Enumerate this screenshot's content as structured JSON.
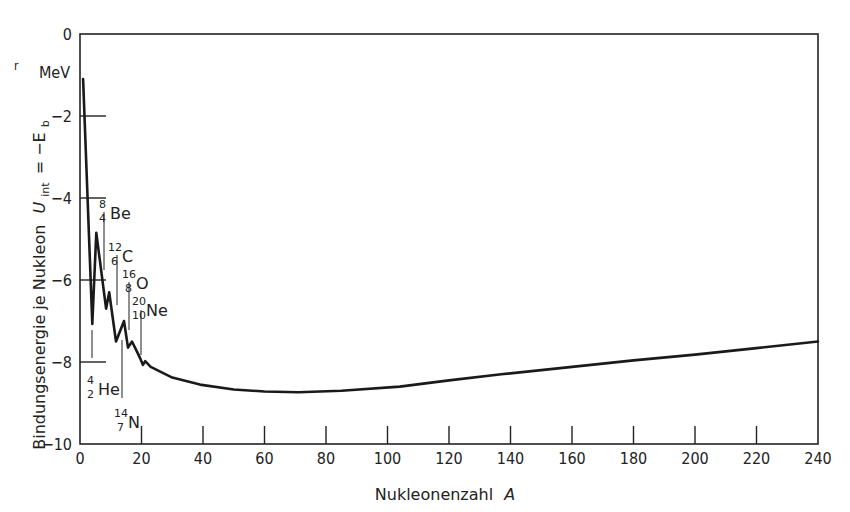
{
  "chart_data": {
    "type": "line",
    "title": "",
    "xlabel": "Nukleonenzahl",
    "xlabel_var": "A",
    "ylabel": "Bindungsenergie je Nukleon",
    "ylabel_formula": {
      "var": "U",
      "sub": "int",
      "rhs": "= −E",
      "rhs_sub": "b"
    },
    "yunit": "MeV",
    "xlim": [
      0,
      240
    ],
    "ylim": [
      -10,
      0
    ],
    "xticks": [
      0,
      20,
      40,
      60,
      80,
      100,
      120,
      140,
      160,
      180,
      200,
      220,
      240
    ],
    "yticks": [
      0,
      -2,
      -4,
      -6,
      -8,
      -10
    ],
    "ytick_labels": [
      "0",
      "-2",
      "-4",
      "-6",
      "-8",
      "-10"
    ],
    "grid": false,
    "series": [
      {
        "name": "Bindungsenergie je Nukleon",
        "x": [
          1,
          4,
          5.3,
          8.5,
          9.5,
          11.7,
          14.3,
          15.6,
          16.9,
          19.5,
          20.5,
          21.2,
          23,
          30,
          39,
          50,
          60,
          71,
          85,
          104,
          120,
          137,
          160,
          180,
          200,
          220,
          240
        ],
        "y": [
          -1.1,
          -7.07,
          -4.85,
          -6.7,
          -6.3,
          -7.5,
          -7.0,
          -7.65,
          -7.5,
          -7.9,
          -8.07,
          -7.98,
          -8.12,
          -8.38,
          -8.55,
          -8.67,
          -8.72,
          -8.74,
          -8.7,
          -8.6,
          -8.45,
          -8.3,
          -8.12,
          -7.96,
          -7.82,
          -7.66,
          -7.5
        ]
      }
    ],
    "annotations": [
      {
        "symbol": "He",
        "mass": "4",
        "charge": "2",
        "x": 4,
        "position": "below"
      },
      {
        "symbol": "Be",
        "mass": "8",
        "charge": "4",
        "x": 8,
        "position": "above"
      },
      {
        "symbol": "C",
        "mass": "12",
        "charge": "6",
        "x": 12,
        "position": "above"
      },
      {
        "symbol": "N",
        "mass": "14",
        "charge": "7",
        "x": 14,
        "position": "below"
      },
      {
        "symbol": "O",
        "mass": "16",
        "charge": "8",
        "x": 16,
        "position": "above"
      },
      {
        "symbol": "Ne",
        "mass": "20",
        "charge": "10",
        "x": 20,
        "position": "above"
      }
    ]
  },
  "fragment_text": "r"
}
